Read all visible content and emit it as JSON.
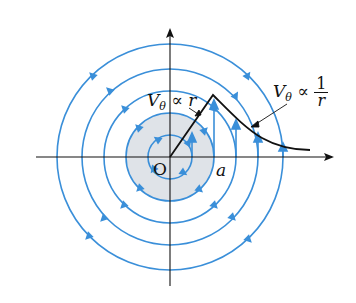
{
  "diagram": {
    "type": "free vortex / Rankine vortex streamlines",
    "colors": {
      "streamline": "#3a8fd9",
      "core_fill": "#dfe3e8",
      "axis": "#111111",
      "profile": "#111111"
    },
    "center": {
      "x": 170,
      "y": 157
    },
    "core_radius": 44,
    "streamline_radii": [
      22,
      43,
      66,
      88,
      113
    ],
    "flow_direction": "counterclockwise",
    "labels": {
      "origin": "O",
      "core_radius": "a",
      "inner_law_v": "V",
      "inner_law_sub": "θ",
      "inner_law_rel": "∝",
      "inner_law_rhs": "r",
      "outer_law_v": "V",
      "outer_law_sub": "θ",
      "outer_law_rel": "∝",
      "outer_law_num": "1",
      "outer_law_den": "r"
    },
    "velocity_profile": {
      "inner_segment": "linear from O to peak at r = a",
      "outer_segment": "decays as 1/r beyond r = a"
    }
  }
}
